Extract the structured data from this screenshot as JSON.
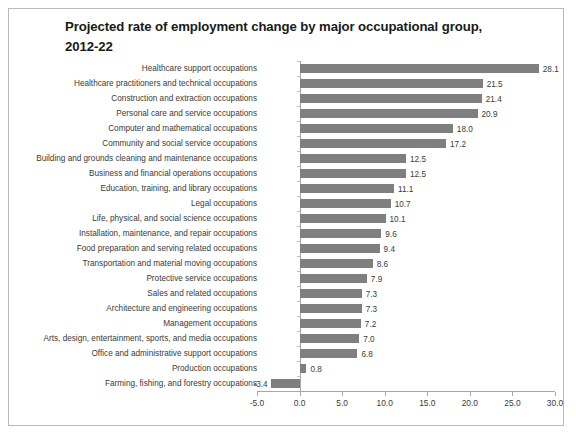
{
  "chart_data": {
    "type": "bar",
    "orientation": "horizontal",
    "title": "Projected rate of employment change by major occupational group, 2012-22",
    "xlabel": "",
    "ylabel": "",
    "xlim": [
      -5.0,
      30.0
    ],
    "xticks": [
      "-5.0",
      "0.0",
      "5.0",
      "10.0",
      "15.0",
      "20.0",
      "25.0",
      "30.0"
    ],
    "xtick_values": [
      -5.0,
      0.0,
      5.0,
      10.0,
      15.0,
      20.0,
      25.0,
      30.0
    ],
    "grid": false,
    "legend": "none",
    "bar_color": "#7f7f7f",
    "categories": [
      "Healthcare support occupations",
      "Healthcare practitioners and technical occupations",
      "Construction and extraction occupations",
      "Personal care and service occupations",
      "Computer and mathematical occupations",
      "Community and social service occupations",
      "Building and grounds cleaning and maintenance occupations",
      "Business and financial operations occupations",
      "Education, training, and library occupations",
      "Legal occupations",
      "Life, physical, and social science occupations",
      "Installation, maintenance, and repair occupations",
      "Food preparation and serving related occupations",
      "Transportation and material moving occupations",
      "Protective service occupations",
      "Sales and related occupations",
      "Architecture and engineering occupations",
      "Management occupations",
      "Arts, design, entertainment, sports, and media occupations",
      "Office and administrative support occupations",
      "Production occupations",
      "Farming, fishing, and forestry occupations"
    ],
    "values": [
      28.1,
      21.5,
      21.4,
      20.9,
      18.0,
      17.2,
      12.5,
      12.5,
      11.1,
      10.7,
      10.1,
      9.6,
      9.4,
      8.6,
      7.9,
      7.3,
      7.3,
      7.2,
      7.0,
      6.8,
      0.8,
      -3.4
    ],
    "value_labels": [
      "28.1",
      "21.5",
      "21.4",
      "20.9",
      "18.0",
      "17.2",
      "12.5",
      "12.5",
      "11.1",
      "10.7",
      "10.1",
      "9.6",
      "9.4",
      "8.6",
      "7.9",
      "7.3",
      "7.3",
      "7.2",
      "7.0",
      "6.8",
      "0.8",
      "-3.4"
    ]
  }
}
